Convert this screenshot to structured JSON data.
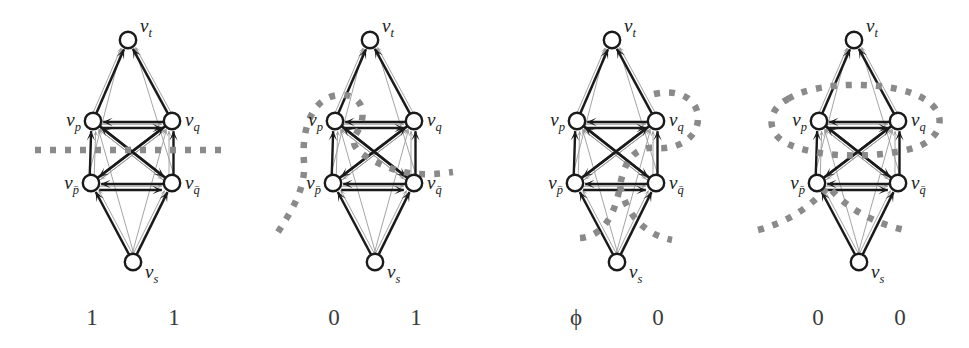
{
  "figure": {
    "type": "diagram",
    "kind": "graph-construction-panels",
    "background": "#ffffff",
    "ink_color": "#1a1a1a",
    "faint_edge_color": "#9a9a9a",
    "dotted_cut_color": "#8a8a8a",
    "width": 969,
    "height": 348,
    "panel_count": 4
  },
  "node_labels": {
    "t": {
      "base": "v",
      "sub": "t"
    },
    "p": {
      "base": "v",
      "sub": "p"
    },
    "q": {
      "base": "v",
      "sub": "q"
    },
    "pbar": {
      "base": "v",
      "sub": "p̄"
    },
    "qbar": {
      "base": "v",
      "sub": "q̄"
    },
    "s": {
      "base": "v",
      "sub": "s"
    }
  },
  "node_label_text": {
    "t": "v_t",
    "p": "v_p",
    "q": "v_q",
    "pbar": "v_pbar",
    "qbar": "v_qbar",
    "s": "v_s"
  },
  "panels": [
    {
      "id": "panel-1",
      "index": 1,
      "cut_style": "horizontal-dotted-line",
      "cut_description": "straight horizontal dotted line crossing the whole panel between the upper and lower literal nodes",
      "values": {
        "left": "1",
        "right": "1"
      },
      "left_value": "1",
      "right_value": "1"
    },
    {
      "id": "panel-2",
      "index": 2,
      "cut_style": "loop-around-vp",
      "cut_description": "dotted curve looping around v_p, descending diagonally to the right between the nodes and exiting right; a second dotted arc enters from the lower left",
      "values": {
        "left": "0",
        "right": "1"
      },
      "left_value": "0",
      "right_value": "1"
    },
    {
      "id": "panel-3",
      "index": 3,
      "cut_style": "loop-around-vq",
      "cut_description": "dotted curve looping around v_q from the right, dropping down through the middle and flaring out as a valley below",
      "values": {
        "left": "ϕ",
        "right": "0"
      },
      "left_value": "ϕ",
      "right_value": "0"
    },
    {
      "id": "panel-4",
      "index": 4,
      "cut_style": "ellipse-around-vp-vq",
      "cut_description": "large dotted ellipse enclosing both v_p and v_q, plus a dotted valley curve below between the lower nodes",
      "values": {
        "left": "0",
        "right": "0"
      },
      "left_value": "0",
      "right_value": "0"
    }
  ]
}
